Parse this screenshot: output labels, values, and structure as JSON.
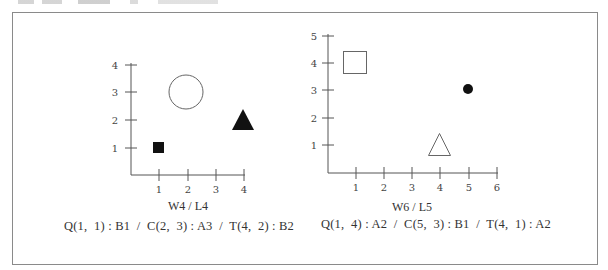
{
  "figures": [
    {
      "id": "left",
      "title": "W4 / L4",
      "x_ticks": [
        "1",
        "2",
        "3",
        "4"
      ],
      "y_ticks": [
        "1",
        "2",
        "3",
        "4"
      ],
      "caption": "Q(1,  1) : B1  /  C(2,  3) : A3  /  T(4,  2) : B2",
      "shapes": [
        {
          "type": "square",
          "label": "Q",
          "x": 1,
          "y": 1,
          "filled": true,
          "size": "small",
          "color": "#111111"
        },
        {
          "type": "circle",
          "label": "C",
          "x": 2,
          "y": 3,
          "filled": false,
          "size": "large",
          "color": "#555555"
        },
        {
          "type": "triangle",
          "label": "T",
          "x": 4,
          "y": 2,
          "filled": true,
          "size": "medium",
          "color": "#111111"
        }
      ]
    },
    {
      "id": "right",
      "title": "W6 / L5",
      "x_ticks": [
        "1",
        "2",
        "3",
        "4",
        "5",
        "6"
      ],
      "y_ticks": [
        "1",
        "2",
        "3",
        "4",
        "5"
      ],
      "caption": "Q(1,  4) : A2  /  C(5,  3) : B1  /  T(4,  1) : A2",
      "shapes": [
        {
          "type": "square",
          "label": "Q",
          "x": 1,
          "y": 4,
          "filled": false,
          "size": "medium",
          "color": "#555555"
        },
        {
          "type": "circle",
          "label": "C",
          "x": 5,
          "y": 3,
          "filled": true,
          "size": "small",
          "color": "#111111"
        },
        {
          "type": "triangle",
          "label": "T",
          "x": 4,
          "y": 1,
          "filled": false,
          "size": "medium",
          "color": "#555555"
        }
      ]
    }
  ]
}
